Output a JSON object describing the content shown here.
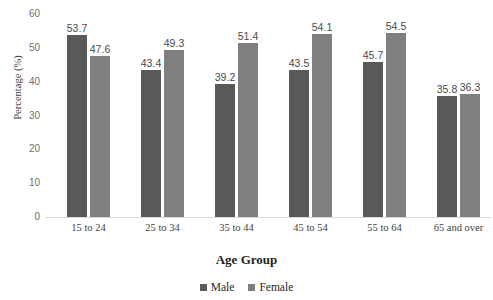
{
  "chart_data": {
    "type": "bar",
    "title": "",
    "xlabel": "Age Group",
    "ylabel": "Percentage (%)",
    "categories": [
      "15 to 24",
      "25 to 34",
      "35 to 44",
      "45 to 54",
      "55 to 64",
      "65 and over"
    ],
    "series": [
      {
        "name": "Male",
        "color": "#595959",
        "values": [
          53.7,
          43.4,
          39.2,
          43.5,
          45.7,
          35.8
        ]
      },
      {
        "name": "Female",
        "color": "#7f7f7f",
        "values": [
          47.6,
          49.3,
          51.4,
          54.1,
          54.5,
          36.3
        ]
      }
    ],
    "ylim": [
      0,
      60
    ],
    "yticks": [
      "0",
      "10",
      "20",
      "30",
      "40",
      "50",
      "60"
    ],
    "grid": false,
    "legend_position": "bottom",
    "data_labels": true
  },
  "legend": {
    "entries": [
      {
        "label": "Male"
      },
      {
        "label": "Female"
      }
    ]
  },
  "labels": {
    "clipped_title": ""
  }
}
